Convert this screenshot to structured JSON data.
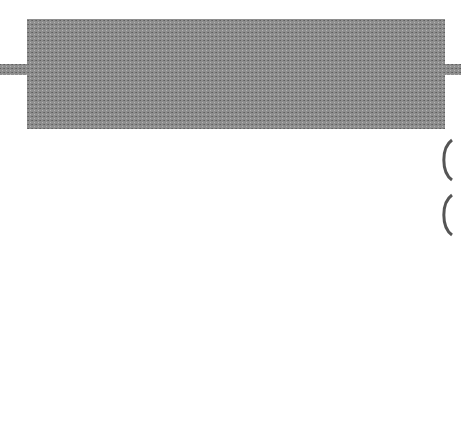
{
  "colors": {
    "frame": "#8a8a8a",
    "background": "#ffffff",
    "inner_fill": "#d9d9d9",
    "ink": "#111111"
  },
  "nodes": {
    "sedimentary_rock": {
      "line1": "sedimentary",
      "line2": "rock",
      "shape": "ellipse"
    },
    "sediment": {
      "label": "sediment",
      "shape": "rectangle"
    },
    "metamorphic_rock": {
      "line1": "metamorphic",
      "line2": "rock",
      "shape": "ellipse"
    },
    "igneous_rock": {
      "line1": "igneous",
      "line2": "rock",
      "shape": "ellipse"
    },
    "magma": {
      "label": "magma",
      "shape": "rectangle"
    }
  },
  "edges": {
    "compaction": {
      "label": "Compaction - cementation",
      "from": "sediment",
      "to": "sedimentary rock"
    },
    "sed_erosion": {
      "label": "erosion- weathering",
      "from": "sedimentary rock",
      "to": "sediment"
    },
    "heat_pressure_down": {
      "label": "heat - pressure",
      "from": "sedimentary rock",
      "to": "metamorphic rock"
    },
    "met_erosion": {
      "label": "erosion- weathering",
      "from": "metamorphic rock",
      "to": "sediment"
    },
    "ign_erosion": {
      "label": "erosion - weathering",
      "from": "igneous rock",
      "to": "sediment"
    },
    "heat_pressure_right": {
      "label": "heat - pressure",
      "from": "metamorphic rock",
      "to": "igneous rock"
    },
    "melting": {
      "label": "melting",
      "from": "metamorphic rock",
      "to": "magma"
    },
    "cooling": {
      "line1": "cooling-",
      "line2": "crystalization",
      "from": "magma",
      "to": "igneous rock"
    }
  }
}
